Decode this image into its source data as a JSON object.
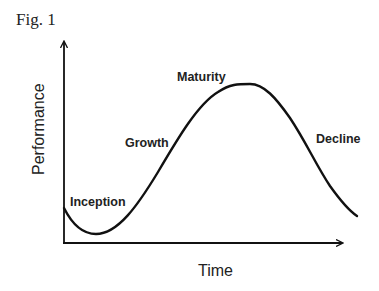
{
  "figure": {
    "label": "Fig. 1"
  },
  "diagram": {
    "type": "lifecycle-curve",
    "y_axis_label": "Performance",
    "x_axis_label": "Time",
    "stages": [
      {
        "name": "Inception"
      },
      {
        "name": "Growth"
      },
      {
        "name": "Maturity"
      },
      {
        "name": "Decline"
      }
    ],
    "colors": {
      "curve": "#111111",
      "axes": "#111111",
      "text": "#222222"
    }
  }
}
